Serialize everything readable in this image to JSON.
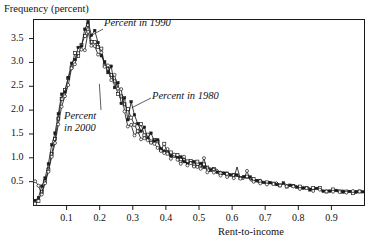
{
  "chart_data": {
    "type": "line",
    "title": "",
    "subtitle": "",
    "xlabel": "Rent-to-income",
    "ylabel": "Frequency (percent)",
    "xlim": [
      0.0,
      1.0
    ],
    "ylim": [
      0.0,
      3.9
    ],
    "grid": false,
    "legend_position": "inline-annotations",
    "x_ticks": [
      0.1,
      0.2,
      0.3,
      0.4,
      0.5,
      0.6,
      0.7,
      0.8,
      0.9
    ],
    "x_tick_labels": [
      "0.1",
      "0.2",
      "0.3",
      "0.4",
      "0.5",
      "0.6",
      "0.7",
      "0.8",
      "0.9"
    ],
    "y_ticks": [
      0.5,
      1.0,
      1.5,
      2.0,
      2.5,
      3.0,
      3.5
    ],
    "y_tick_labels": [
      "0.5",
      "1.0",
      "1.5",
      "2.0",
      "2.5",
      "3.0",
      "3.5"
    ],
    "annotations": [
      {
        "text": "Percent in 1990",
        "target_x": 0.165,
        "target_y": 3.55
      },
      {
        "text": "Percent in 1980",
        "target_x": 0.285,
        "target_y": 2.05
      },
      {
        "text": "Percent in 2000",
        "target_x": 0.205,
        "target_y": 2.55
      }
    ],
    "series": [
      {
        "name": "Percent in 1980",
        "marker": "open-square",
        "x": [
          0.005,
          0.015,
          0.025,
          0.035,
          0.045,
          0.055,
          0.065,
          0.075,
          0.085,
          0.095,
          0.105,
          0.115,
          0.125,
          0.135,
          0.145,
          0.155,
          0.165,
          0.175,
          0.185,
          0.195,
          0.205,
          0.215,
          0.225,
          0.235,
          0.245,
          0.255,
          0.265,
          0.275,
          0.285,
          0.295,
          0.305,
          0.315,
          0.325,
          0.335,
          0.345,
          0.355,
          0.365,
          0.375,
          0.385,
          0.395,
          0.405,
          0.415,
          0.425,
          0.435,
          0.445,
          0.455,
          0.465,
          0.475,
          0.485,
          0.495,
          0.505,
          0.515,
          0.525,
          0.535,
          0.545,
          0.555,
          0.565,
          0.575,
          0.585,
          0.595,
          0.605,
          0.615,
          0.625,
          0.635,
          0.645,
          0.655,
          0.665,
          0.675,
          0.685,
          0.695,
          0.705,
          0.715,
          0.725,
          0.735,
          0.745,
          0.755,
          0.765,
          0.775,
          0.785,
          0.795,
          0.805,
          0.815,
          0.825,
          0.835,
          0.845,
          0.855,
          0.865,
          0.875,
          0.885,
          0.895,
          0.905,
          0.915,
          0.925,
          0.935,
          0.945,
          0.955,
          0.965,
          0.975,
          0.985,
          0.995
        ],
        "values": [
          0.05,
          0.12,
          0.3,
          0.52,
          0.78,
          1.1,
          1.45,
          1.82,
          2.18,
          2.48,
          2.62,
          2.95,
          3.22,
          3.18,
          3.42,
          3.52,
          3.78,
          3.38,
          3.45,
          3.3,
          3.28,
          3.0,
          2.88,
          2.78,
          2.62,
          2.4,
          2.35,
          2.2,
          2.1,
          1.92,
          1.72,
          1.62,
          1.66,
          1.52,
          1.48,
          1.4,
          1.34,
          1.28,
          1.22,
          1.25,
          1.1,
          1.12,
          1.02,
          1.04,
          0.96,
          0.98,
          0.92,
          0.94,
          0.86,
          0.9,
          0.84,
          0.86,
          0.78,
          0.8,
          0.74,
          0.76,
          0.7,
          0.72,
          0.66,
          0.68,
          0.62,
          0.64,
          0.6,
          0.62,
          0.58,
          0.56,
          0.54,
          0.56,
          0.52,
          0.5,
          0.5,
          0.48,
          0.46,
          0.48,
          0.44,
          0.44,
          0.42,
          0.42,
          0.4,
          0.4,
          0.38,
          0.38,
          0.36,
          0.36,
          0.35,
          0.34,
          0.34,
          0.33,
          0.32,
          0.32,
          0.31,
          0.31,
          0.3,
          0.3,
          0.29,
          0.29,
          0.28,
          0.28,
          0.28,
          0.27
        ]
      },
      {
        "name": "Percent in 1990",
        "marker": "filled-square",
        "x": [
          0.005,
          0.015,
          0.025,
          0.035,
          0.045,
          0.055,
          0.065,
          0.075,
          0.085,
          0.095,
          0.105,
          0.115,
          0.125,
          0.135,
          0.145,
          0.155,
          0.165,
          0.175,
          0.185,
          0.195,
          0.205,
          0.215,
          0.225,
          0.235,
          0.245,
          0.255,
          0.265,
          0.275,
          0.285,
          0.295,
          0.305,
          0.315,
          0.325,
          0.335,
          0.345,
          0.355,
          0.365,
          0.375,
          0.385,
          0.395,
          0.405,
          0.415,
          0.425,
          0.435,
          0.445,
          0.455,
          0.465,
          0.475,
          0.485,
          0.495,
          0.505,
          0.515,
          0.525,
          0.535,
          0.545,
          0.555,
          0.565,
          0.575,
          0.585,
          0.595,
          0.605,
          0.615,
          0.625,
          0.635,
          0.645,
          0.655,
          0.665,
          0.675,
          0.685,
          0.695,
          0.705,
          0.715,
          0.725,
          0.735,
          0.745,
          0.755,
          0.765,
          0.775,
          0.785,
          0.795,
          0.805,
          0.815,
          0.825,
          0.835,
          0.845,
          0.855,
          0.865,
          0.875,
          0.885,
          0.895,
          0.905,
          0.915,
          0.925,
          0.935,
          0.945,
          0.955,
          0.965,
          0.975,
          0.985,
          0.995
        ],
        "values": [
          0.08,
          0.18,
          0.38,
          0.6,
          0.88,
          1.22,
          1.58,
          1.92,
          2.28,
          2.42,
          2.75,
          3.05,
          3.1,
          3.3,
          3.28,
          3.62,
          3.82,
          3.52,
          3.6,
          3.42,
          3.12,
          3.05,
          2.8,
          2.9,
          2.55,
          2.62,
          2.2,
          2.32,
          1.86,
          2.1,
          1.9,
          1.68,
          1.54,
          1.6,
          1.38,
          1.46,
          1.3,
          1.36,
          1.18,
          1.16,
          1.14,
          1.06,
          1.08,
          0.98,
          1.0,
          0.92,
          0.9,
          0.88,
          0.92,
          0.84,
          0.88,
          0.8,
          0.82,
          0.76,
          0.78,
          0.72,
          0.74,
          0.68,
          0.7,
          0.64,
          0.66,
          0.62,
          0.58,
          0.6,
          0.56,
          0.58,
          0.54,
          0.52,
          0.54,
          0.5,
          0.48,
          0.5,
          0.46,
          0.46,
          0.44,
          0.46,
          0.42,
          0.4,
          0.42,
          0.38,
          0.38,
          0.36,
          0.38,
          0.35,
          0.34,
          0.36,
          0.33,
          0.32,
          0.34,
          0.31,
          0.3,
          0.32,
          0.3,
          0.29,
          0.3,
          0.28,
          0.28,
          0.29,
          0.27,
          0.28
        ]
      },
      {
        "name": "Percent in 2000",
        "marker": "open-circle",
        "x": [
          0.005,
          0.015,
          0.025,
          0.035,
          0.045,
          0.055,
          0.065,
          0.075,
          0.085,
          0.095,
          0.105,
          0.115,
          0.125,
          0.135,
          0.145,
          0.155,
          0.165,
          0.175,
          0.185,
          0.195,
          0.205,
          0.215,
          0.225,
          0.235,
          0.245,
          0.255,
          0.265,
          0.275,
          0.285,
          0.295,
          0.305,
          0.315,
          0.325,
          0.335,
          0.345,
          0.355,
          0.365,
          0.375,
          0.385,
          0.395,
          0.405,
          0.415,
          0.425,
          0.435,
          0.445,
          0.455,
          0.465,
          0.475,
          0.485,
          0.495,
          0.505,
          0.515,
          0.525,
          0.535,
          0.545,
          0.555,
          0.565,
          0.575,
          0.585,
          0.595,
          0.605,
          0.615,
          0.625,
          0.635,
          0.645,
          0.655,
          0.665,
          0.675,
          0.685,
          0.695,
          0.705,
          0.715,
          0.725,
          0.735,
          0.745,
          0.755,
          0.765,
          0.775,
          0.785,
          0.795,
          0.805,
          0.815,
          0.825,
          0.835,
          0.845,
          0.855,
          0.865,
          0.875,
          0.885,
          0.895,
          0.905,
          0.915,
          0.925,
          0.935,
          0.945,
          0.955,
          0.965,
          0.975,
          0.985,
          0.995
        ],
        "values": [
          0.5,
          0.42,
          0.22,
          0.45,
          0.7,
          1.02,
          1.38,
          1.7,
          2.02,
          2.32,
          2.55,
          2.8,
          3.02,
          3.12,
          3.25,
          3.3,
          3.58,
          3.3,
          3.34,
          3.2,
          3.18,
          2.92,
          2.95,
          2.7,
          2.72,
          2.48,
          2.5,
          2.02,
          1.7,
          1.62,
          1.44,
          1.58,
          1.4,
          1.44,
          1.32,
          1.3,
          1.22,
          1.24,
          1.16,
          1.1,
          1.18,
          1.0,
          1.06,
          0.94,
          0.9,
          1.0,
          0.84,
          0.9,
          0.8,
          0.82,
          0.78,
          1.0,
          0.72,
          0.74,
          0.7,
          0.68,
          0.64,
          0.66,
          0.6,
          0.62,
          0.58,
          0.8,
          0.56,
          0.54,
          0.72,
          0.52,
          0.5,
          0.52,
          0.48,
          0.5,
          0.46,
          0.48,
          0.44,
          0.46,
          0.42,
          0.44,
          0.4,
          0.42,
          0.38,
          0.4,
          0.36,
          0.38,
          0.35,
          0.36,
          0.33,
          0.35,
          0.32,
          0.34,
          0.31,
          0.33,
          0.3,
          0.32,
          0.29,
          0.31,
          0.28,
          0.3,
          0.28,
          0.29,
          0.27,
          0.28
        ]
      }
    ]
  }
}
